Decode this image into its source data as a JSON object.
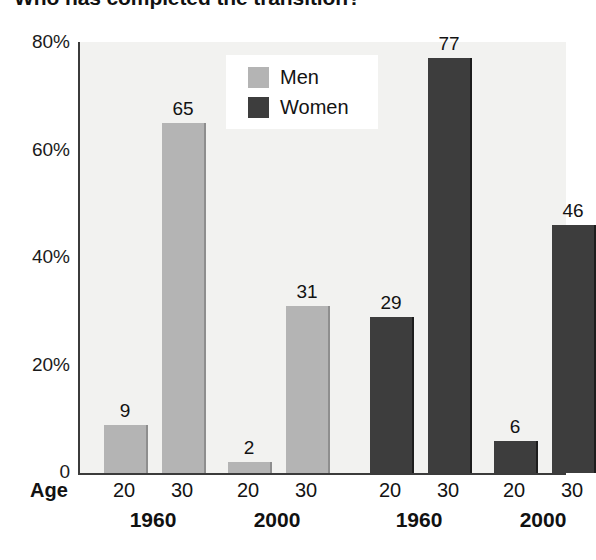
{
  "chart_data": {
    "type": "bar",
    "title": "Who has completed the transition?",
    "xlabel": "Age",
    "ylabel": "",
    "ylim": [
      0,
      80
    ],
    "grid": false,
    "legend_position": "top-center",
    "y_ticks": [
      {
        "value": 80,
        "label": "80%"
      },
      {
        "value": 60,
        "label": "60%"
      },
      {
        "value": 40,
        "label": "40%"
      },
      {
        "value": 20,
        "label": "20%"
      },
      {
        "value": 0,
        "label": "0"
      }
    ],
    "series": [
      {
        "name": "Men",
        "color": "#b4b4b4"
      },
      {
        "name": "Women",
        "color": "#3d3d3d"
      }
    ],
    "groups": [
      {
        "series": "Men",
        "year": "1960",
        "age": "20",
        "value": 9,
        "label": "9"
      },
      {
        "series": "Men",
        "year": "1960",
        "age": "30",
        "value": 65,
        "label": "65"
      },
      {
        "series": "Men",
        "year": "2000",
        "age": "20",
        "value": 2,
        "label": "2"
      },
      {
        "series": "Men",
        "year": "2000",
        "age": "30",
        "value": 31,
        "label": "31"
      },
      {
        "series": "Women",
        "year": "1960",
        "age": "20",
        "value": 29,
        "label": "29"
      },
      {
        "series": "Women",
        "year": "1960",
        "age": "30",
        "value": 77,
        "label": "77"
      },
      {
        "series": "Women",
        "year": "2000",
        "age": "20",
        "value": 6,
        "label": "6"
      },
      {
        "series": "Women",
        "year": "2000",
        "age": "30",
        "value": 46,
        "label": "46"
      }
    ],
    "categories": [
      "Men 1960 / 20",
      "Men 1960 / 30",
      "Men 2000 / 20",
      "Men 2000 / 30",
      "Women 1960 / 20",
      "Women 1960 / 30",
      "Women 2000 / 20",
      "Women 2000 / 30"
    ],
    "values": [
      9,
      65,
      2,
      31,
      29,
      77,
      6,
      46
    ],
    "year_groups": [
      "1960",
      "2000",
      "1960",
      "2000"
    ],
    "age_ticks": [
      "20",
      "30",
      "20",
      "30",
      "20",
      "30",
      "20",
      "30"
    ]
  },
  "legend": {
    "items": [
      {
        "label": "Men",
        "color": "#b4b4b4"
      },
      {
        "label": "Women",
        "color": "#3d3d3d"
      }
    ]
  },
  "axis": {
    "age_label": "Age"
  },
  "colors": {
    "men": "#b4b4b4",
    "women": "#3d3d3d",
    "plot_background": "#f2f2f0",
    "axis_line": "#3b3b3b",
    "text": "#131313"
  }
}
